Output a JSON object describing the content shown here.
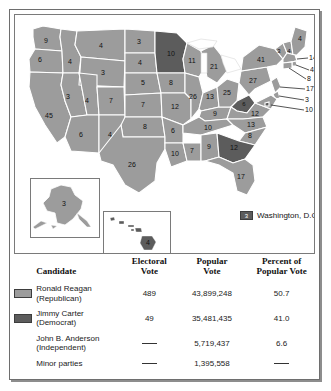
{
  "figure": {
    "map": {
      "title": "1980 Presidential Election Electoral Map",
      "legend": {
        "dc_value": "3",
        "dc_label": "Washington, D.C."
      },
      "colors": {
        "republican": "#9c9c9c",
        "democrat": "#5c5c5c",
        "water": "#ffffff",
        "border": "#ffffff"
      },
      "states": [
        {
          "code": "WA",
          "votes": "9",
          "x": 31,
          "y": 26,
          "party": "R"
        },
        {
          "code": "OR",
          "votes": "6",
          "x": 25,
          "y": 45,
          "party": "R"
        },
        {
          "code": "CA",
          "votes": "45",
          "x": 34,
          "y": 101,
          "party": "R"
        },
        {
          "code": "NV",
          "votes": "3",
          "x": 53,
          "y": 82,
          "party": "R"
        },
        {
          "code": "ID",
          "votes": "4",
          "x": 55,
          "y": 47,
          "party": "R"
        },
        {
          "code": "MT",
          "votes": "4",
          "x": 86,
          "y": 31,
          "party": "R"
        },
        {
          "code": "WY",
          "votes": "3",
          "x": 88,
          "y": 58,
          "party": "R"
        },
        {
          "code": "UT",
          "votes": "4",
          "x": 66,
          "y": 86,
          "party": "R"
        },
        {
          "code": "AZ",
          "votes": "6",
          "x": 63,
          "y": 122,
          "party": "R"
        },
        {
          "code": "NM",
          "votes": "4",
          "x": 88,
          "y": 124,
          "party": "R"
        },
        {
          "code": "CO",
          "votes": "7",
          "x": 96,
          "y": 86,
          "party": "R"
        },
        {
          "code": "ND",
          "votes": "3",
          "x": 120,
          "y": 29,
          "party": "R"
        },
        {
          "code": "SD",
          "votes": "4",
          "x": 121,
          "y": 47,
          "party": "R"
        },
        {
          "code": "NE",
          "votes": "5",
          "x": 125,
          "y": 70,
          "party": "R"
        },
        {
          "code": "KS",
          "votes": "7",
          "x": 126,
          "y": 92,
          "party": "R"
        },
        {
          "code": "OK",
          "votes": "8",
          "x": 130,
          "y": 113,
          "party": "R"
        },
        {
          "code": "TX",
          "votes": "26",
          "x": 117,
          "y": 149,
          "party": "R"
        },
        {
          "code": "MN",
          "votes": "10",
          "x": 156,
          "y": 39,
          "party": "D"
        },
        {
          "code": "IA",
          "votes": "8",
          "x": 154,
          "y": 68,
          "party": "R"
        },
        {
          "code": "MO",
          "votes": "12",
          "x": 160,
          "y": 93,
          "party": "R"
        },
        {
          "code": "AR",
          "votes": "6",
          "x": 158,
          "y": 117,
          "party": "R"
        },
        {
          "code": "LA",
          "votes": "10",
          "x": 163,
          "y": 140,
          "party": "R"
        },
        {
          "code": "WI",
          "votes": "11",
          "x": 175,
          "y": 45,
          "party": "R"
        },
        {
          "code": "IL",
          "votes": "26",
          "x": 178,
          "y": 80,
          "party": "R"
        },
        {
          "code": "MS",
          "votes": "7",
          "x": 178,
          "y": 133,
          "party": "R"
        },
        {
          "code": "MI",
          "votes": "21",
          "x": 196,
          "y": 51,
          "party": "R"
        },
        {
          "code": "IN",
          "votes": "13",
          "x": 194,
          "y": 81,
          "party": "R"
        },
        {
          "code": "KY",
          "votes": "9",
          "x": 199,
          "y": 101,
          "party": "R"
        },
        {
          "code": "TN",
          "votes": "10",
          "x": 197,
          "y": 114,
          "party": "R"
        },
        {
          "code": "AL",
          "votes": "9",
          "x": 194,
          "y": 133,
          "party": "R"
        },
        {
          "code": "OH",
          "votes": "25",
          "x": 211,
          "y": 78,
          "party": "R"
        },
        {
          "code": "WV",
          "votes": "6",
          "x": 230,
          "y": 90,
          "party": "D"
        },
        {
          "code": "GA",
          "votes": "12",
          "x": 213,
          "y": 131,
          "party": "D"
        },
        {
          "code": "FL",
          "votes": "17",
          "x": 228,
          "y": 157,
          "party": "R"
        },
        {
          "code": "SC",
          "votes": "8",
          "x": 226,
          "y": 122,
          "party": "R"
        },
        {
          "code": "NC",
          "votes": "13",
          "x": 232,
          "y": 110,
          "party": "R"
        },
        {
          "code": "VA",
          "votes": "12",
          "x": 241,
          "y": 95,
          "party": "R"
        },
        {
          "code": "PA",
          "votes": "27",
          "x": 240,
          "y": 63,
          "party": "R"
        },
        {
          "code": "NY",
          "votes": "41",
          "x": 248,
          "y": 45,
          "party": "R"
        },
        {
          "code": "VT",
          "votes": "3",
          "x": 265,
          "y": 33,
          "party": "R"
        },
        {
          "code": "NH",
          "votes": "4",
          "x": 275,
          "y": 36,
          "party": "R"
        },
        {
          "code": "ME",
          "votes": "4",
          "x": 285,
          "y": 22,
          "party": "R"
        },
        {
          "code": "AK",
          "votes": "3",
          "x": 48,
          "y": 186,
          "party": "R"
        },
        {
          "code": "HI",
          "votes": "4",
          "x": 142,
          "y": 231,
          "party": "D"
        }
      ],
      "leader_labels": [
        {
          "code": "MA",
          "votes": "14",
          "x": 296,
          "y": 43
        },
        {
          "code": "RI",
          "votes": "4",
          "x": 297,
          "y": 55
        },
        {
          "code": "CT",
          "votes": "8",
          "x": 294,
          "y": 64
        },
        {
          "code": "NJ",
          "votes": "17",
          "x": 293,
          "y": 74
        },
        {
          "code": "DE",
          "votes": "3",
          "x": 292,
          "y": 85
        },
        {
          "code": "MD",
          "votes": "10",
          "x": 292,
          "y": 95
        }
      ]
    },
    "table": {
      "headers": {
        "candidate": "Candidate",
        "electoral_vote": "Electoral\nVote",
        "electoral_vote_l1": "Electoral",
        "electoral_vote_l2": "Vote",
        "popular_vote_l1": "Popular",
        "popular_vote_l2": "Vote",
        "percent_l1": "Percent of",
        "percent_l2": "Popular Vote"
      },
      "rows": [
        {
          "swatch": "light",
          "name": "Ronald Reagan",
          "party": "(Republican)",
          "electoral_vote": "489",
          "popular_vote": "43,899,248",
          "percent": "50.7"
        },
        {
          "swatch": "dark",
          "name": "Jimmy Carter",
          "party": "(Democrat)",
          "electoral_vote": "49",
          "popular_vote": "35,481,435",
          "percent": "41.0"
        },
        {
          "swatch": "none",
          "name": "John B. Anderson",
          "party": "(Independent)",
          "electoral_vote": "—",
          "popular_vote": "5,719,437",
          "percent": "6.6"
        },
        {
          "swatch": "none",
          "name": "Minor parties",
          "party": "",
          "electoral_vote": "—",
          "popular_vote": "1,395,558",
          "percent": "—"
        }
      ]
    }
  }
}
